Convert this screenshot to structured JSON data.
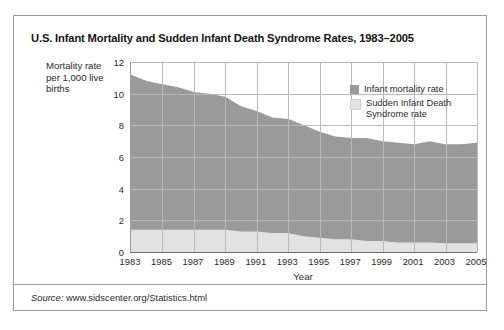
{
  "figure": {
    "title": "U.S. Infant Mortality and Sudden Infant Death Syndrome Rates, 1983–2005",
    "source_prefix": "Source:",
    "source_url": "www.sidscenter.org/Statistics.html",
    "border_color": "#9b9b9b",
    "background": "#ffffff"
  },
  "legend": {
    "position": "top-right-inside",
    "items": [
      {
        "label": "Infant mortality rate",
        "color": "#9a9a9a"
      },
      {
        "label": "Sudden Infant Death Syndrome rate",
        "color": "#e2e2e2"
      }
    ]
  },
  "chart_data": {
    "type": "area",
    "title": "U.S. Infant Mortality and Sudden Infant Death Syndrome Rates, 1983–2005",
    "xlabel": "Year",
    "ylabel": "Mortality rate per 1,000 live births",
    "grid": true,
    "stacked": false,
    "ylim": [
      0,
      12
    ],
    "xlim": [
      1983,
      2005
    ],
    "yticks": [
      0,
      2,
      4,
      6,
      8,
      10,
      12
    ],
    "xticks": [
      1983,
      1985,
      1987,
      1989,
      1991,
      1993,
      1995,
      1997,
      1999,
      2001,
      2003,
      2005
    ],
    "x": [
      1983,
      1984,
      1985,
      1986,
      1987,
      1988,
      1989,
      1990,
      1991,
      1992,
      1993,
      1994,
      1995,
      1996,
      1997,
      1998,
      1999,
      2000,
      2001,
      2002,
      2003,
      2004,
      2005
    ],
    "series": [
      {
        "name": "Infant mortality rate",
        "color": "#9a9a9a",
        "values": [
          11.2,
          10.8,
          10.6,
          10.4,
          10.1,
          10.0,
          9.8,
          9.2,
          8.9,
          8.5,
          8.4,
          8.0,
          7.6,
          7.3,
          7.2,
          7.2,
          7.0,
          6.9,
          6.8,
          7.0,
          6.8,
          6.8,
          6.9
        ]
      },
      {
        "name": "Sudden Infant Death Syndrome rate",
        "color": "#e2e2e2",
        "values": [
          1.4,
          1.4,
          1.4,
          1.4,
          1.4,
          1.4,
          1.4,
          1.3,
          1.3,
          1.2,
          1.2,
          1.0,
          0.9,
          0.8,
          0.8,
          0.7,
          0.7,
          0.6,
          0.6,
          0.6,
          0.55,
          0.55,
          0.55
        ]
      }
    ]
  }
}
